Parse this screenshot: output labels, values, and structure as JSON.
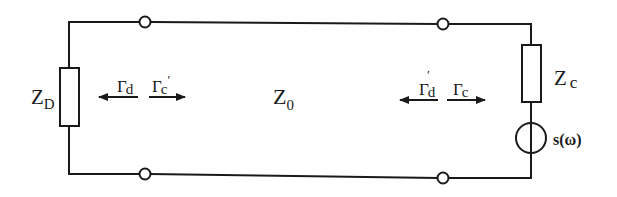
{
  "diagram": {
    "type": "transmission-line circuit",
    "labels": {
      "load_impedance": {
        "main": "Z",
        "sub": "D"
      },
      "line_impedance": {
        "main": "Z",
        "sub": "0"
      },
      "source_impedance": {
        "main": "Z",
        "sub": "c"
      },
      "source": "s(ω)",
      "gamma_d": {
        "main": "Γ",
        "sub": "d"
      },
      "gamma_c_prime": {
        "main": "Γ",
        "sub": "c",
        "prime": "′"
      },
      "gamma_d_prime": {
        "main": "Γ",
        "sub": "d",
        "prime": "′"
      },
      "gamma_c": {
        "main": "Γ",
        "sub": "c"
      }
    },
    "colors": {
      "stroke": "#1a1a1a",
      "background": "#ffffff"
    }
  }
}
